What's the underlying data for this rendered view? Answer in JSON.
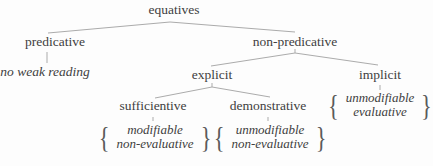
{
  "colors": {
    "background": "#fdfdfd",
    "text": "#404040",
    "line": "#ababab"
  },
  "tree": {
    "root": "equatives",
    "predicative": "predicative",
    "non_predicative": "non-predicative",
    "no_weak_reading": "no weak reading",
    "explicit": "explicit",
    "implicit": "implicit",
    "sufficientive": "sufficientive",
    "demonstrative": "demonstrative",
    "features": {
      "sufficientive": {
        "line1": "modifiable",
        "line2": "non-evaluative"
      },
      "demonstrative": {
        "line1": "unmodifiable",
        "line2": "non-evaluative"
      },
      "implicit": {
        "line1": "unmodifiable",
        "line2": "evaluative"
      }
    }
  },
  "icons": {
    "brace_open": "{",
    "brace_close": "}"
  }
}
